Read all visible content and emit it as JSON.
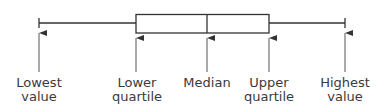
{
  "diagram": {
    "type": "box-and-whisker",
    "colors": {
      "line": "#333333",
      "text": "#3a3a3a",
      "background": "#ffffff"
    },
    "geometry": {
      "whisker_y": 23,
      "box_top": 14,
      "box_bottom": 33,
      "lowest_x": 39,
      "lower_quartile_x": 136,
      "median_x": 207,
      "upper_quartile_x": 269,
      "highest_x": 345
    },
    "labels": [
      {
        "id": "lowest",
        "line1": "Lowest",
        "line2": "value"
      },
      {
        "id": "lower-quartile",
        "line1": "Lower",
        "line2": "quartile"
      },
      {
        "id": "median",
        "line1": "Median",
        "line2": ""
      },
      {
        "id": "upper-quartile",
        "line1": "Upper",
        "line2": "quartile"
      },
      {
        "id": "highest",
        "line1": "Highest",
        "line2": "value"
      }
    ]
  }
}
